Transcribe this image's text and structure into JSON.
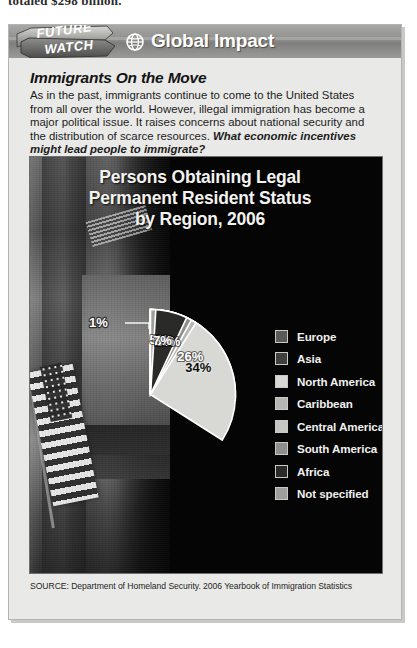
{
  "page": {
    "running_text_cut_off": "totaled $298 billion."
  },
  "header": {
    "ribbon_line1": "FUTURE",
    "ribbon_line2": "WATCH",
    "globe_icon": "globe-icon",
    "title": "Global Impact"
  },
  "intro": {
    "heading": "Immigrants On the Move",
    "body": "As in the past, immigrants continue to come to the United States from all over the world. However, illegal immigration has become a major political issue. It raises concerns about national security and the distribution of scarce resources. ",
    "question": "What economic incentives might lead people to immigrate?"
  },
  "chart_data": {
    "type": "pie",
    "title": "Persons Obtaining Legal Permanent Resident Status by Region, 2006",
    "title_lines": [
      "Persons Obtaining Legal",
      "Permanent Resident Status",
      "by Region, 2006"
    ],
    "xlabel": "",
    "ylabel": "",
    "legend_position": "right",
    "grid": false,
    "units": "percent",
    "categories": [
      "Europe",
      "Asia",
      "North America",
      "Caribbean",
      "Central America",
      "South America",
      "Africa",
      "Not specified"
    ],
    "values": [
      10,
      26,
      34,
      9,
      5,
      8,
      7,
      1
    ],
    "labels": [
      "10%",
      "26%",
      "34%",
      "9%",
      "5%",
      "8%",
      "7%",
      "1%"
    ],
    "colors": [
      "#5a5a58",
      "#3f3f3d",
      "#d8d8d4",
      "#b6b6b2",
      "#c6c6c2",
      "#8f8f8b",
      "#2a2a28",
      "#9e9e9a"
    ],
    "slices": [
      {
        "name": "Europe",
        "value": 10,
        "label": "10%",
        "color": "#5a5a58",
        "label_color": "light"
      },
      {
        "name": "Asia",
        "value": 26,
        "label": "26%",
        "color": "#3f3f3d",
        "label_color": "light"
      },
      {
        "name": "North America",
        "value": 34,
        "label": "34%",
        "color": "#d8d8d4",
        "label_color": "dark"
      },
      {
        "name": "Caribbean",
        "value": 9,
        "label": "9%",
        "color": "#b6b6b2",
        "label_color": "light"
      },
      {
        "name": "Central America",
        "value": 5,
        "label": "5%",
        "color": "#c6c6c2",
        "label_color": "light"
      },
      {
        "name": "South America",
        "value": 8,
        "label": "8%",
        "color": "#8f8f8b",
        "label_color": "light"
      },
      {
        "name": "Africa",
        "value": 7,
        "label": "7%",
        "color": "#2a2a28",
        "label_color": "light"
      },
      {
        "name": "Not specified",
        "value": 1,
        "label": "1%",
        "color": "#9e9e9a",
        "label_color": "light"
      }
    ],
    "callout": {
      "label": "1%",
      "for_slice": "Not specified"
    }
  },
  "legend": [
    {
      "label": "Europe",
      "color": "#5a5a58"
    },
    {
      "label": "Asia",
      "color": "#3f3f3d"
    },
    {
      "label": "North America",
      "color": "#d8d8d4"
    },
    {
      "label": "Caribbean",
      "color": "#b6b6b2"
    },
    {
      "label": "Central America",
      "color": "#c6c6c2"
    },
    {
      "label": "South America",
      "color": "#8f8f8b"
    },
    {
      "label": "Africa",
      "color": "#2a2a28"
    },
    {
      "label": "Not specified",
      "color": "#9e9e9a"
    }
  ],
  "source": {
    "text": "SOURCE: Department of Homeland Security. 2006 Yearbook of Immigration Statistics"
  }
}
